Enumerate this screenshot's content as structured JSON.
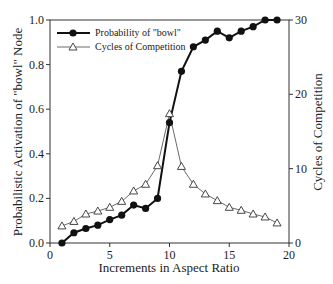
{
  "chart_data": {
    "type": "line",
    "title": "",
    "xlabel": "Increments in Aspect Ratio",
    "ylabel": "Probabilistic Activation of \"bowl\" Node",
    "y2label": "Cycles of Competition",
    "xlim": [
      0,
      20
    ],
    "ylim": [
      0,
      1.0
    ],
    "y2lim": [
      0,
      30
    ],
    "xticks": [
      "0",
      "5",
      "10",
      "15",
      "20"
    ],
    "yticks": [
      "0.0",
      "0.2",
      "0.4",
      "0.6",
      "0.8",
      "1.0"
    ],
    "y2ticks": [
      "0",
      "10",
      "20",
      "30"
    ],
    "grid": false,
    "legend_position": "upper left",
    "x": [
      1,
      2,
      3,
      4,
      5,
      6,
      7,
      8,
      9,
      10,
      11,
      12,
      13,
      14,
      15,
      16,
      17,
      18,
      19
    ],
    "series": [
      {
        "name": "Probability of \"bowl\"",
        "axis": "left",
        "marker": "filled-circle",
        "values": [
          0.0,
          0.046,
          0.065,
          0.08,
          0.105,
          0.125,
          0.17,
          0.155,
          0.2,
          0.54,
          0.77,
          0.88,
          0.91,
          0.95,
          0.92,
          0.95,
          0.97,
          1.0,
          1.0
        ]
      },
      {
        "name": "Cycles of Competition",
        "axis": "right",
        "marker": "open-triangle",
        "values": [
          2.3,
          2.9,
          3.9,
          4.3,
          4.8,
          5.6,
          7.0,
          7.9,
          10.4,
          17.4,
          10.3,
          7.9,
          6.6,
          5.7,
          4.8,
          4.4,
          3.9,
          3.5,
          2.7
        ]
      }
    ]
  }
}
